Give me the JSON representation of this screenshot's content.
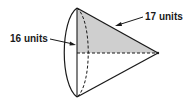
{
  "figure": {
    "type": "cone-on-side",
    "colors": {
      "stroke": "#1a1a1a",
      "shade": "#cfcfcf",
      "background": "#ffffff"
    },
    "labels": {
      "height": "16 units",
      "slant": "17 units"
    }
  }
}
